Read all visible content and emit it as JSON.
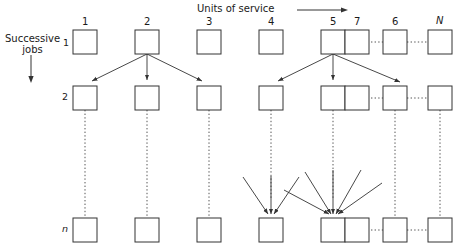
{
  "diagram": {
    "title_x_axis": "Units of service",
    "title_y_axis_line1": "Successive",
    "title_y_axis_line2": "jobs",
    "x_axis_arrow": "right-arrow",
    "y_axis_arrow": "down-arrow",
    "column_labels": [
      "1",
      "2",
      "3",
      "4",
      "5",
      "6",
      "7",
      "N"
    ],
    "row_labels": [
      "1",
      "2",
      "n"
    ],
    "node_label": "square-node",
    "colors": {
      "stroke": "#333333",
      "node_fill": "#ffffff",
      "dotted": "#555555",
      "text": "#1a1a1a"
    },
    "geometry": {
      "columns_x": [
        73,
        135,
        197,
        259,
        321,
        383,
        445,
        507
      ],
      "rows_y": [
        30,
        86,
        218
      ],
      "node_size": 24,
      "col_count": 8,
      "row_count": 3
    },
    "fanouts": [
      {
        "from_row": 0,
        "from_col": 1,
        "to_cols": [
          0,
          1,
          2
        ],
        "arrow_count": 3
      },
      {
        "from_row": 0,
        "from_col": 4,
        "to_cols": [
          3,
          4,
          6
        ],
        "arrow_count": 3
      }
    ],
    "convergences": [
      {
        "to_row": 2,
        "to_col": 3,
        "arrow_count": 3
      },
      {
        "to_row": 2,
        "to_col": 4,
        "arrow_count": 5
      }
    ],
    "dotted_vertical_count": 8,
    "dotted_horizontal_rows": [
      0,
      1,
      2
    ]
  }
}
